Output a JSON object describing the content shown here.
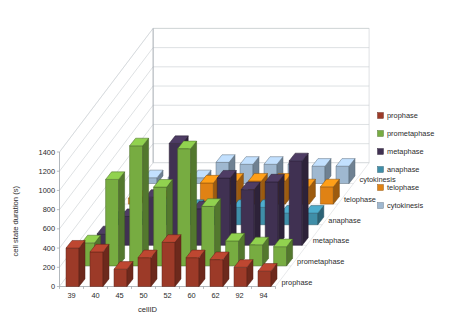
{
  "chart_data": {
    "type": "bar",
    "variant": "3d-clustered-bar",
    "title": "",
    "xlabel": "cellID",
    "ylabel": "cell state duration (s)",
    "zlabel": "",
    "ylim": [
      0,
      1400
    ],
    "ytick_step": 200,
    "yticks": [
      0,
      200,
      400,
      600,
      800,
      1000,
      1200,
      1400
    ],
    "ytick_labels": [
      "0",
      "200",
      "400",
      "600",
      "800",
      "1000",
      "1200",
      "1400"
    ],
    "grid": true,
    "legend_position": "right",
    "categories": [
      "39",
      "40",
      "45",
      "50",
      "52",
      "60",
      "62",
      "92",
      "94"
    ],
    "series": [
      {
        "name": "prophase",
        "color": "#9C3A28",
        "values": [
          400,
          360,
          180,
          300,
          460,
          300,
          280,
          200,
          160
        ]
      },
      {
        "name": "prometaphase",
        "color": "#77AC41",
        "values": [
          240,
          900,
          1250,
          820,
          1220,
          620,
          260,
          220,
          200
        ]
      },
      {
        "name": "metaphase",
        "color": "#403152",
        "values": [
          120,
          300,
          500,
          1060,
          380,
          700,
          580,
          660,
          880
        ]
      },
      {
        "name": "anaphase",
        "color": "#3F8EA8",
        "values": [
          60,
          60,
          200,
          180,
          80,
          180,
          180,
          120,
          120
        ]
      },
      {
        "name": "telophase",
        "color": "#E08214",
        "values": [
          60,
          60,
          240,
          220,
          240,
          240,
          240,
          180,
          180
        ]
      },
      {
        "name": "cytokinesis",
        "color": "#9FB8D0",
        "values": [
          60,
          60,
          60,
          220,
          200,
          200,
          200,
          180,
          180
        ]
      }
    ]
  },
  "legend": {
    "items": [
      {
        "label": "prophase",
        "color": "#9C3A28"
      },
      {
        "label": "prometaphase",
        "color": "#77AC41"
      },
      {
        "label": "metaphase",
        "color": "#403152"
      },
      {
        "label": "anaphase",
        "color": "#3F8EA8"
      },
      {
        "label": "telophase",
        "color": "#E08214"
      },
      {
        "label": "cytokinesis",
        "color": "#9FB8D0"
      }
    ]
  },
  "series_axis_labels": [
    "prophase",
    "prometaphase",
    "metaphase",
    "anaphase",
    "telophase",
    "cytokinesis"
  ]
}
